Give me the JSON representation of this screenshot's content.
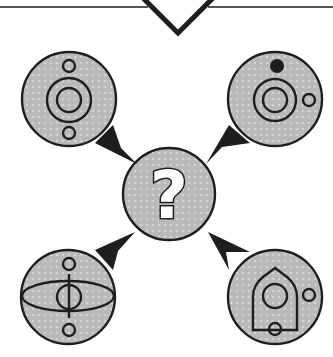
{
  "puzzle": {
    "title": "Which symbol belongs in the center?",
    "center_symbol": "?",
    "colors": {
      "background": "#ffffff",
      "disc_fill": "#b9b9b9",
      "stroke": "#1e1e1e",
      "dot_texture": "#d2d2d2"
    },
    "discs": [
      {
        "id": "top-left",
        "description": "small circle above, concentric double ring, small circle below"
      },
      {
        "id": "top-right",
        "description": "filled dot above, concentric double ring, small circle right"
      },
      {
        "id": "center",
        "description": "question mark"
      },
      {
        "id": "bottom-left",
        "description": "small circle above, horizontal ellipse with vertical line and circle, small circle below"
      },
      {
        "id": "bottom-right",
        "description": "house-shaped outline with inner circle, small circle right, small circle on bottom edge"
      }
    ],
    "arrows": [
      {
        "from": "top-left",
        "to": "center"
      },
      {
        "from": "top-right",
        "to": "center"
      },
      {
        "from": "bottom-left",
        "to": "center"
      },
      {
        "from": "bottom-right",
        "to": "center"
      }
    ]
  }
}
